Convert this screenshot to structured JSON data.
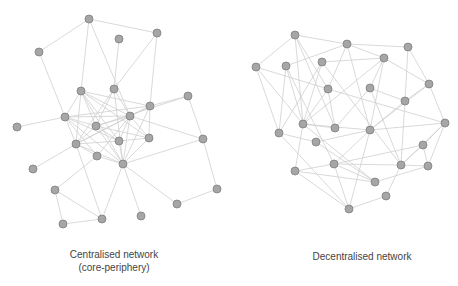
{
  "diagrams": [
    {
      "id": "centralised",
      "caption_line1": "Centralised network",
      "caption_line2": "(core-periphery)",
      "nodes": [
        [
          89,
          19
        ],
        [
          157,
          33
        ],
        [
          119,
          39
        ],
        [
          39,
          52
        ],
        [
          81,
          91
        ],
        [
          114,
          89
        ],
        [
          188,
          96
        ],
        [
          150,
          106
        ],
        [
          65,
          117
        ],
        [
          130,
          116
        ],
        [
          17,
          127
        ],
        [
          96,
          126
        ],
        [
          203,
          139
        ],
        [
          149,
          138
        ],
        [
          119,
          141
        ],
        [
          76,
          144
        ],
        [
          97,
          156
        ],
        [
          123,
          164
        ],
        [
          33,
          169
        ],
        [
          55,
          190
        ],
        [
          217,
          189
        ],
        [
          177,
          204
        ],
        [
          102,
          219
        ],
        [
          141,
          216
        ],
        [
          63,
          224
        ]
      ],
      "edges": [
        [
          0,
          1
        ],
        [
          0,
          3
        ],
        [
          0,
          4
        ],
        [
          0,
          9
        ],
        [
          2,
          5
        ],
        [
          1,
          5
        ],
        [
          1,
          7
        ],
        [
          3,
          8
        ],
        [
          4,
          8
        ],
        [
          4,
          9
        ],
        [
          4,
          11
        ],
        [
          4,
          13
        ],
        [
          4,
          14
        ],
        [
          4,
          15
        ],
        [
          4,
          7
        ],
        [
          4,
          17
        ],
        [
          5,
          9
        ],
        [
          5,
          11
        ],
        [
          5,
          15
        ],
        [
          5,
          17
        ],
        [
          6,
          7
        ],
        [
          6,
          12
        ],
        [
          6,
          11
        ],
        [
          7,
          9
        ],
        [
          7,
          8
        ],
        [
          7,
          13
        ],
        [
          7,
          17
        ],
        [
          7,
          15
        ],
        [
          8,
          9
        ],
        [
          8,
          11
        ],
        [
          8,
          14
        ],
        [
          8,
          15
        ],
        [
          8,
          17
        ],
        [
          8,
          16
        ],
        [
          9,
          11
        ],
        [
          9,
          13
        ],
        [
          9,
          14
        ],
        [
          9,
          15
        ],
        [
          9,
          17
        ],
        [
          9,
          16
        ],
        [
          10,
          8
        ],
        [
          11,
          14
        ],
        [
          11,
          13
        ],
        [
          11,
          17
        ],
        [
          11,
          15
        ],
        [
          12,
          9
        ],
        [
          12,
          17
        ],
        [
          12,
          20
        ],
        [
          13,
          14
        ],
        [
          13,
          17
        ],
        [
          14,
          15
        ],
        [
          14,
          17
        ],
        [
          15,
          16
        ],
        [
          15,
          17
        ],
        [
          15,
          18
        ],
        [
          15,
          22
        ],
        [
          16,
          17
        ],
        [
          16,
          19
        ],
        [
          17,
          22
        ],
        [
          17,
          23
        ],
        [
          17,
          21
        ],
        [
          19,
          22
        ],
        [
          19,
          24
        ],
        [
          24,
          22
        ],
        [
          20,
          21
        ]
      ]
    },
    {
      "id": "decentralised",
      "caption_line1": "Decentralised network",
      "nodes": [
        [
          295,
          35
        ],
        [
          347,
          44
        ],
        [
          408,
          47
        ],
        [
          256,
          67
        ],
        [
          286,
          66
        ],
        [
          322,
          62
        ],
        [
          384,
          58
        ],
        [
          429,
          84
        ],
        [
          328,
          89
        ],
        [
          370,
          88
        ],
        [
          405,
          101
        ],
        [
          303,
          124
        ],
        [
          335,
          128
        ],
        [
          445,
          123
        ],
        [
          279,
          133
        ],
        [
          370,
          130
        ],
        [
          316,
          142
        ],
        [
          423,
          145
        ],
        [
          334,
          164
        ],
        [
          401,
          165
        ],
        [
          428,
          166
        ],
        [
          295,
          171
        ],
        [
          375,
          182
        ],
        [
          386,
          196
        ],
        [
          349,
          209
        ]
      ],
      "edges": [
        [
          0,
          1
        ],
        [
          0,
          3
        ],
        [
          0,
          11
        ],
        [
          0,
          8
        ],
        [
          0,
          12
        ],
        [
          1,
          2
        ],
        [
          1,
          6
        ],
        [
          1,
          8
        ],
        [
          1,
          15
        ],
        [
          1,
          4
        ],
        [
          2,
          7
        ],
        [
          2,
          10
        ],
        [
          3,
          14
        ],
        [
          3,
          8
        ],
        [
          3,
          11
        ],
        [
          4,
          11
        ],
        [
          4,
          14
        ],
        [
          4,
          18
        ],
        [
          5,
          11
        ],
        [
          5,
          14
        ],
        [
          5,
          6
        ],
        [
          5,
          19
        ],
        [
          6,
          9
        ],
        [
          6,
          7
        ],
        [
          6,
          15
        ],
        [
          6,
          11
        ],
        [
          7,
          10
        ],
        [
          7,
          13
        ],
        [
          7,
          15
        ],
        [
          8,
          12
        ],
        [
          8,
          13
        ],
        [
          8,
          11
        ],
        [
          9,
          10
        ],
        [
          9,
          19
        ],
        [
          9,
          12
        ],
        [
          10,
          15
        ],
        [
          10,
          19
        ],
        [
          11,
          12
        ],
        [
          11,
          21
        ],
        [
          11,
          22
        ],
        [
          11,
          15
        ],
        [
          14,
          16
        ],
        [
          14,
          24
        ],
        [
          15,
          13
        ],
        [
          15,
          18
        ],
        [
          15,
          24
        ],
        [
          15,
          16
        ],
        [
          16,
          22
        ],
        [
          17,
          18
        ],
        [
          17,
          20
        ],
        [
          17,
          13
        ],
        [
          17,
          19
        ],
        [
          18,
          22
        ],
        [
          18,
          24
        ],
        [
          18,
          19
        ],
        [
          19,
          20
        ],
        [
          19,
          13
        ],
        [
          20,
          13
        ],
        [
          21,
          18
        ],
        [
          21,
          22
        ],
        [
          21,
          24
        ],
        [
          22,
          20
        ],
        [
          23,
          24
        ],
        [
          23,
          19
        ]
      ]
    }
  ],
  "style": {
    "node_fill": "#a6a6a6",
    "node_stroke": "#7f7f7f",
    "edge_color": "#cfcfcf",
    "text_color": "#444444"
  }
}
